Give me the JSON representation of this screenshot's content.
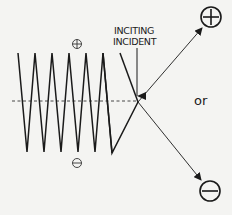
{
  "diagram": {
    "annotation_line1": "INCITING",
    "annotation_line2": "INCIDENT",
    "connector": "or",
    "positive_symbol": "⊕",
    "negative_symbol": "⊖",
    "zigzag_peaks_count": 7,
    "zigzag_valleys_count": 6,
    "outcomes": [
      {
        "name": "positive",
        "symbol": "plus"
      },
      {
        "name": "negative",
        "symbol": "minus"
      }
    ],
    "colors": {
      "line": "#1a1a1a",
      "background": "#f4f4f2"
    }
  }
}
